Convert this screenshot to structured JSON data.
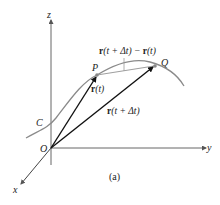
{
  "figure": {
    "caption": "(a)",
    "axes": {
      "z": "z",
      "y": "y",
      "x": "x"
    },
    "origin_label": "O",
    "curve_label": "C",
    "points": {
      "P": "P",
      "Q": "Q"
    },
    "vectors": {
      "r_t": {
        "bold": "r",
        "rest": "(t)"
      },
      "r_t_dt": {
        "bold": "r",
        "rest": "(t + Δt)"
      },
      "difference": {
        "bold1": "r",
        "rest1": "(t + Δt) − ",
        "bold2": "r",
        "rest2": "(t)"
      }
    },
    "colors": {
      "curve": "#8a8a8a",
      "vector": "#111111",
      "chord": "#9a9a9a",
      "axis": "#555555"
    }
  }
}
